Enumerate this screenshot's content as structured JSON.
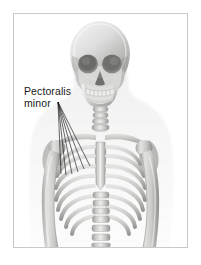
{
  "figure": {
    "border_color": "#c9c9c9",
    "background_color": "#ffffff"
  },
  "labels": [
    {
      "id": "pectoralis-minor",
      "line1": "Pectoralis",
      "line2": "minor",
      "text": "Pectoralis minor",
      "color": "#1a1a1a"
    }
  ],
  "anatomy": {
    "parts": [
      "skull",
      "mandible",
      "teeth",
      "eye-sockets",
      "nasal-cavity",
      "cervical-vertebrae",
      "clavicle-left",
      "clavicle-right",
      "scapula-left",
      "scapula-right",
      "sternum",
      "ribs",
      "humerus-left",
      "humerus-right",
      "lumbar-vertebrae"
    ],
    "bone_tone_light": "#e8e8e6",
    "bone_tone_mid": "#b9b9b7",
    "bone_tone_dark": "#8a8a88",
    "cavity_tone": "#6f6f6d"
  },
  "leader_lines": {
    "count": 6,
    "color": "#1b1b1b",
    "target_region": "left-upper-chest"
  }
}
